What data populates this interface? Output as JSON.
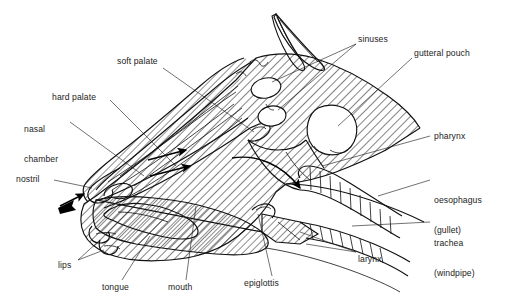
{
  "diagram": {
    "background_color": "#ffffff",
    "line_color": "#111111",
    "text_color": "#222222",
    "hatch_pattern": "diagonal-45",
    "labels": [
      {
        "id": "soft-palate",
        "text": "soft palate",
        "x": 117,
        "y": 60,
        "align": "left"
      },
      {
        "id": "hard-palate",
        "text": "hard palate",
        "x": 52,
        "y": 96,
        "align": "left"
      },
      {
        "id": "nasal-chamber",
        "line1": "nasal",
        "line2": "chamber",
        "x": 24,
        "y": 112,
        "align": "left"
      },
      {
        "id": "nostril",
        "text": "nostril",
        "x": 16,
        "y": 178,
        "align": "left"
      },
      {
        "id": "lips",
        "text": "lips",
        "x": 58,
        "y": 264,
        "align": "left"
      },
      {
        "id": "tongue",
        "text": "tongue",
        "x": 102,
        "y": 286,
        "align": "left"
      },
      {
        "id": "mouth",
        "text": "mouth",
        "x": 168,
        "y": 286,
        "align": "left"
      },
      {
        "id": "epiglottis",
        "text": "epiglottis",
        "x": 244,
        "y": 282,
        "align": "left"
      },
      {
        "id": "larynx",
        "text": "larynx",
        "x": 358,
        "y": 258,
        "align": "left"
      },
      {
        "id": "sinuses",
        "text": "sinuses",
        "x": 358,
        "y": 38,
        "align": "left"
      },
      {
        "id": "gutteral-pouch",
        "text": "gutteral pouch",
        "x": 414,
        "y": 52,
        "align": "left"
      },
      {
        "id": "pharynx",
        "text": "pharynx",
        "x": 434,
        "y": 135,
        "align": "left"
      },
      {
        "id": "oesophagus",
        "line1": "oesophagus",
        "line2": "(gullet)",
        "x": 434,
        "y": 179,
        "align": "left"
      },
      {
        "id": "trachea",
        "line1": "trachea",
        "line2": "(windpipe)",
        "x": 434,
        "y": 222,
        "align": "left"
      }
    ],
    "structures": [
      {
        "id": "ear-left",
        "name": "ear"
      },
      {
        "id": "ear-right",
        "name": "ear"
      },
      {
        "id": "sinus-cavity-1",
        "name": "sinus cavity"
      },
      {
        "id": "sinus-cavity-2",
        "name": "sinus cavity"
      },
      {
        "id": "guttural-pouch",
        "name": "guttural pouch"
      },
      {
        "id": "nasal-passage",
        "name": "nasal chamber / turbinates"
      },
      {
        "id": "hard-palate",
        "name": "hard palate"
      },
      {
        "id": "soft-palate",
        "name": "soft palate"
      },
      {
        "id": "tongue-body",
        "name": "tongue"
      },
      {
        "id": "epiglottis-flap",
        "name": "epiglottis"
      },
      {
        "id": "larynx-body",
        "name": "larynx"
      },
      {
        "id": "trachea-tube",
        "name": "trachea (windpipe)"
      },
      {
        "id": "oesophagus-tube",
        "name": "oesophagus (gullet)"
      }
    ],
    "airflow_arrows": [
      {
        "id": "arrow-nostril-in",
        "description": "inhaled air entering nostril"
      },
      {
        "id": "arrow-nasal-1",
        "description": "air through nasal chamber"
      },
      {
        "id": "arrow-nasal-2",
        "description": "air through nasal chamber"
      },
      {
        "id": "arrow-pharynx-down",
        "description": "air curving down pharynx to larynx"
      }
    ]
  }
}
